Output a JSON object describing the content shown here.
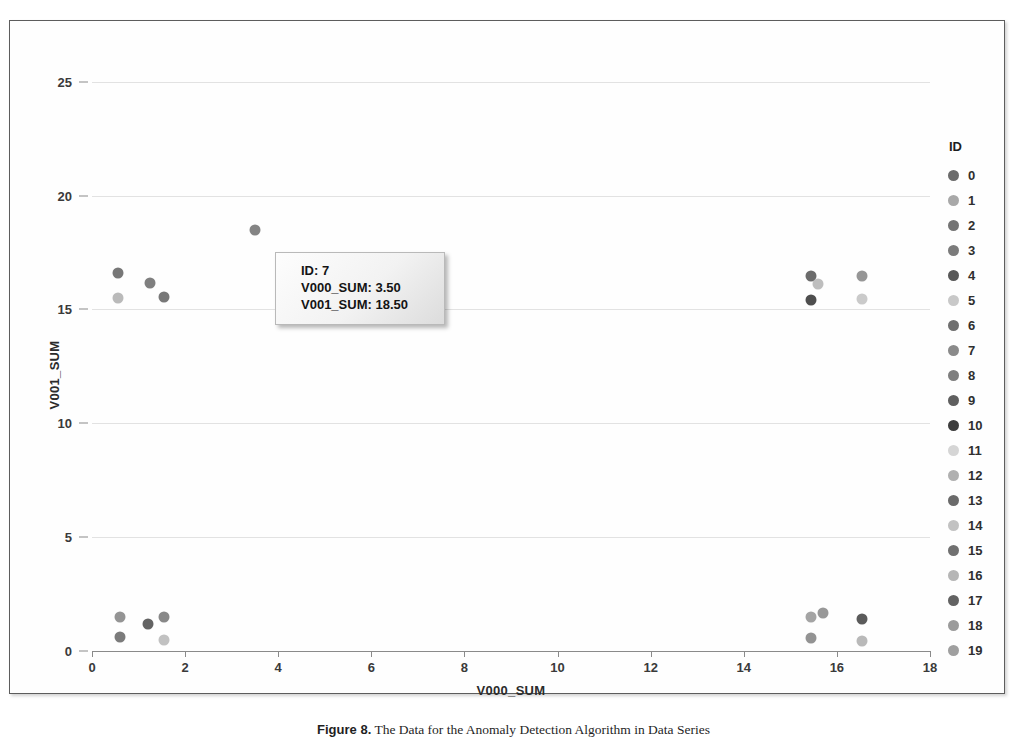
{
  "figure": {
    "caption_label": "Figure 8.",
    "caption_text": "The Data for the Anomaly Detection Algorithm in Data Series"
  },
  "tooltip": {
    "visible": true,
    "rows": [
      {
        "icon": "shape-icon",
        "label": "ID",
        "value": "7"
      },
      {
        "icon": "text-abc-icon",
        "label": "V000_SUM",
        "value": "3.50"
      },
      {
        "icon": "text-abc-icon",
        "label": "V001_SUM",
        "value": "18.50"
      }
    ],
    "line_0": "ID: 7",
    "line_1": "V000_SUM: 3.50",
    "line_2": "V001_SUM: 18.50"
  },
  "legend": {
    "title": "ID",
    "items": [
      {
        "label": "0",
        "color": "#6b6b6b"
      },
      {
        "label": "1",
        "color": "#a8a8a8"
      },
      {
        "label": "2",
        "color": "#747474"
      },
      {
        "label": "3",
        "color": "#7b7b7b"
      },
      {
        "label": "4",
        "color": "#585858"
      },
      {
        "label": "5",
        "color": "#c8c8c8"
      },
      {
        "label": "6",
        "color": "#6f6f6f"
      },
      {
        "label": "7",
        "color": "#8a8a8a"
      },
      {
        "label": "8",
        "color": "#7e7e7e"
      },
      {
        "label": "9",
        "color": "#5f5f5f"
      },
      {
        "label": "10",
        "color": "#3d3d3d"
      },
      {
        "label": "11",
        "color": "#d5d5d5"
      },
      {
        "label": "12",
        "color": "#b0b0b0"
      },
      {
        "label": "13",
        "color": "#6a6a6a"
      },
      {
        "label": "14",
        "color": "#c2c2c2"
      },
      {
        "label": "15",
        "color": "#707070"
      },
      {
        "label": "16",
        "color": "#b6b6b6"
      },
      {
        "label": "17",
        "color": "#626262"
      },
      {
        "label": "18",
        "color": "#9b9b9b"
      },
      {
        "label": "19",
        "color": "#9f9f9f"
      }
    ]
  },
  "chart_data": {
    "type": "scatter",
    "title": "",
    "xlabel": "V000_SUM",
    "ylabel": "V001_SUM",
    "xlim": [
      0,
      18
    ],
    "ylim": [
      0,
      26
    ],
    "xticks": [
      0,
      2,
      4,
      6,
      8,
      10,
      12,
      14,
      16,
      18
    ],
    "yticks": [
      0,
      5,
      10,
      15,
      20,
      25
    ],
    "grid": true,
    "legend_position": "right",
    "legend_title": "ID",
    "series_key": "ID",
    "points": [
      {
        "id": "0",
        "x": 0.55,
        "y": 16.6,
        "color": "#6b6b6b"
      },
      {
        "id": "1",
        "x": 0.55,
        "y": 15.5,
        "color": "#b4b4b4"
      },
      {
        "id": "2",
        "x": 1.25,
        "y": 16.15,
        "color": "#747474"
      },
      {
        "id": "3",
        "x": 1.55,
        "y": 15.55,
        "color": "#6d6d6d"
      },
      {
        "id": "7",
        "x": 3.5,
        "y": 18.5,
        "color": "#7a7a7a"
      },
      {
        "id": "4",
        "x": 15.45,
        "y": 16.45,
        "color": "#5e5e5e"
      },
      {
        "id": "5",
        "x": 15.6,
        "y": 16.1,
        "color": "#b9b9b9"
      },
      {
        "id": "6",
        "x": 15.45,
        "y": 15.4,
        "color": "#3f3f3f"
      },
      {
        "id": "8",
        "x": 16.55,
        "y": 16.45,
        "color": "#8d8d8d"
      },
      {
        "id": "9",
        "x": 16.55,
        "y": 15.45,
        "color": "#c6c6c6"
      },
      {
        "id": "10",
        "x": 0.6,
        "y": 1.5,
        "color": "#8b8b8b"
      },
      {
        "id": "11",
        "x": 0.6,
        "y": 0.6,
        "color": "#707070"
      },
      {
        "id": "12",
        "x": 1.2,
        "y": 1.2,
        "color": "#565656"
      },
      {
        "id": "13",
        "x": 1.55,
        "y": 1.5,
        "color": "#7e7e7e"
      },
      {
        "id": "14",
        "x": 1.55,
        "y": 0.5,
        "color": "#bcbcbc"
      },
      {
        "id": "15",
        "x": 15.45,
        "y": 1.5,
        "color": "#9c9c9c"
      },
      {
        "id": "16",
        "x": 15.7,
        "y": 1.65,
        "color": "#8f8f8f"
      },
      {
        "id": "17",
        "x": 15.45,
        "y": 0.55,
        "color": "#8a8a8a"
      },
      {
        "id": "18",
        "x": 16.55,
        "y": 1.4,
        "color": "#4d4d4d"
      },
      {
        "id": "19",
        "x": 16.55,
        "y": 0.45,
        "color": "#b3b3b3"
      }
    ]
  }
}
